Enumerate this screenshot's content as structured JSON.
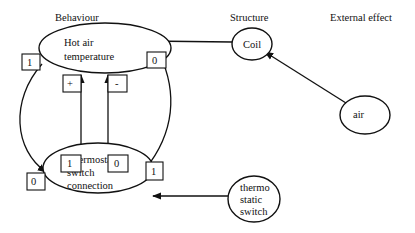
{
  "columns": {
    "behaviour": "Behaviour",
    "structure": "Structure",
    "external": "External effect"
  },
  "nodes": {
    "hot_air": {
      "line1": "Hot air",
      "line2": "temperature"
    },
    "thermostatic_conn": {
      "line1": "Thermostatic",
      "line2": "switch",
      "line3": "connection"
    },
    "coil": {
      "label": "Coil"
    },
    "air": {
      "label": "air"
    },
    "thermo_switch": {
      "line1": "thermo",
      "line2": "static",
      "line3": "switch"
    }
  },
  "edge_labels": {
    "left_outer_top": "1",
    "right_outer_top": "0",
    "inner_left_top": "+",
    "inner_right_top": "-",
    "inner_left_bottom": "1",
    "inner_right_bottom": "0",
    "left_outer_bottom": "0",
    "right_outer_bottom": "1"
  },
  "edges": [
    {
      "from": "Coil",
      "to": "Hot air temperature"
    },
    {
      "from": "air",
      "to": "Coil"
    },
    {
      "from": "thermostatic switch",
      "to": "Thermostatic switch connection"
    },
    {
      "from": "Thermostatic switch connection",
      "to": "Hot air temperature",
      "sign": "+"
    },
    {
      "from": "Thermostatic switch connection",
      "to": "Hot air temperature",
      "sign": "-"
    },
    {
      "from": "Hot air temperature",
      "to": "Thermostatic switch connection",
      "side": "left"
    },
    {
      "from": "Hot air temperature",
      "to": "Thermostatic switch connection",
      "side": "right"
    }
  ]
}
